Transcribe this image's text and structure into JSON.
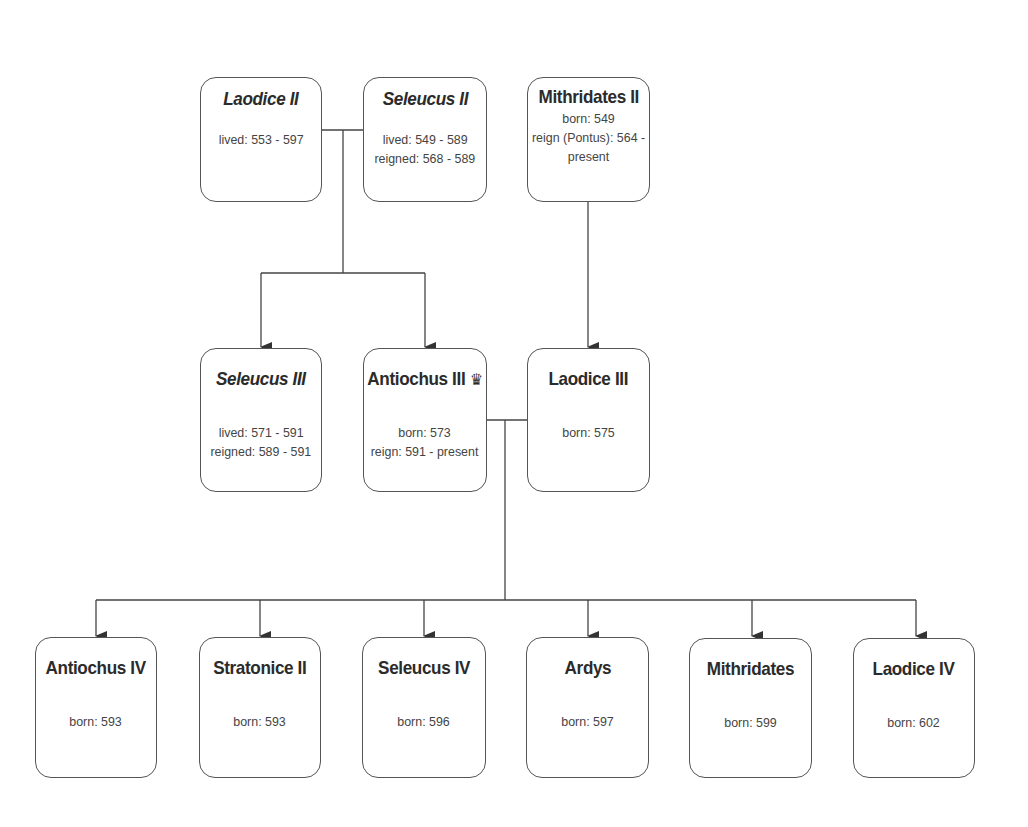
{
  "diagram": {
    "type": "family-tree",
    "nodes": {
      "laodice_ii": {
        "name": "Laodice II",
        "italic": true,
        "lines": [
          "lived: 553 - 597"
        ]
      },
      "seleucus_ii": {
        "name": "Seleucus II",
        "italic": true,
        "lines": [
          "lived: 549 - 589",
          "reigned: 568 - 589"
        ]
      },
      "mithridates_ii": {
        "name": "Mithridates II",
        "italic": false,
        "lines": [
          "born: 549",
          "reign (Pontus): 564 -",
          "present"
        ]
      },
      "seleucus_iii": {
        "name": "Seleucus III",
        "italic": true,
        "lines": [
          "lived: 571 - 591",
          "reigned: 589 - 591"
        ]
      },
      "antiochus_iii": {
        "name": "Antiochus III",
        "italic": false,
        "icon": "♛",
        "lines": [
          "born: 573",
          "reign: 591 - present"
        ]
      },
      "laodice_iii": {
        "name": "Laodice III",
        "italic": false,
        "lines": [
          "born: 575"
        ]
      },
      "antiochus_iv": {
        "name": "Antiochus IV",
        "italic": false,
        "lines": [
          "born: 593"
        ]
      },
      "stratonice_ii": {
        "name": "Stratonice II",
        "italic": false,
        "lines": [
          "born: 593"
        ]
      },
      "seleucus_iv": {
        "name": "Seleucus IV",
        "italic": false,
        "lines": [
          "born: 596"
        ]
      },
      "ardys": {
        "name": "Ardys",
        "italic": false,
        "lines": [
          "born: 597"
        ]
      },
      "mithridates": {
        "name": "Mithridates",
        "italic": false,
        "lines": [
          "born: 599"
        ]
      },
      "laodice_iv": {
        "name": "Laodice IV",
        "italic": false,
        "lines": [
          "born: 602"
        ]
      }
    },
    "marriages": [
      [
        "laodice_ii",
        "seleucus_ii"
      ],
      [
        "antiochus_iii",
        "laodice_iii"
      ]
    ],
    "edges": [
      {
        "from": "laodice_ii+seleucus_ii",
        "to": "seleucus_iii"
      },
      {
        "from": "laodice_ii+seleucus_ii",
        "to": "antiochus_iii"
      },
      {
        "from": "mithridates_ii",
        "to": "laodice_iii"
      },
      {
        "from": "antiochus_iii+laodice_iii",
        "to": "antiochus_iv"
      },
      {
        "from": "antiochus_iii+laodice_iii",
        "to": "stratonice_ii"
      },
      {
        "from": "antiochus_iii+laodice_iii",
        "to": "seleucus_iv"
      },
      {
        "from": "antiochus_iii+laodice_iii",
        "to": "ardys"
      },
      {
        "from": "antiochus_iii+laodice_iii",
        "to": "mithridates"
      },
      {
        "from": "antiochus_iii+laodice_iii",
        "to": "laodice_iv"
      }
    ],
    "colors": {
      "line": "#444444",
      "border": "#555555",
      "text": "#333333",
      "background": "#ffffff"
    }
  }
}
